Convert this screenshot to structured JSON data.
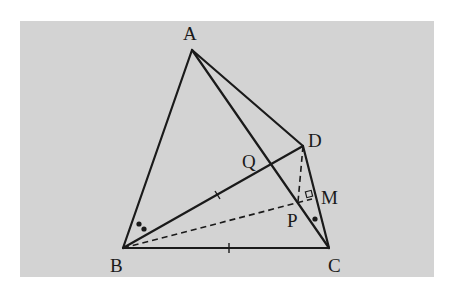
{
  "diagram": {
    "type": "geometry",
    "background_color": "#d3d3d3",
    "line_color": "#1a1a1a",
    "points": {
      "A": {
        "label": "A",
        "x": 192,
        "y": 50
      },
      "B": {
        "label": "B",
        "x": 123,
        "y": 248
      },
      "C": {
        "label": "C",
        "x": 329,
        "y": 248
      },
      "D": {
        "label": "D",
        "x": 303,
        "y": 146
      },
      "Q": {
        "label": "Q",
        "x": 271,
        "y": 165
      },
      "P": {
        "label": "P",
        "x": 298,
        "y": 202
      },
      "M": {
        "label": "M",
        "x": 312,
        "y": 199
      }
    },
    "labels": {
      "A": "A",
      "B": "B",
      "C": "C",
      "D": "D",
      "Q": "Q",
      "P": "P",
      "M": "M"
    },
    "segments_solid": [
      "AB",
      "AC",
      "AD",
      "BC",
      "BD",
      "DC"
    ],
    "segments_dashed": [
      "BM",
      "DP"
    ],
    "marks": {
      "equal_ticks": [
        "BD",
        "BC"
      ],
      "right_angle_at": "M",
      "angle_B_double_dot": true,
      "angle_C_single_dot": true
    }
  }
}
